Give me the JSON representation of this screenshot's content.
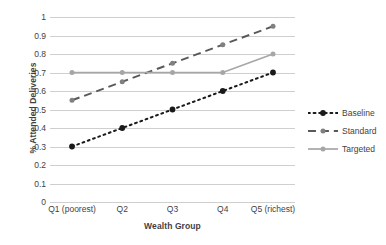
{
  "chart_data": {
    "type": "line",
    "title": "",
    "xlabel": "Wealth Group",
    "ylabel": "% Attended Deliveries",
    "categories": [
      "Q1 (poorest)",
      "Q2",
      "Q3",
      "Q4",
      "Q5 (richest)"
    ],
    "ylim": [
      0,
      1
    ],
    "yticks": [
      "0",
      "0.1",
      "0.2",
      "0.3",
      "0.4",
      "0.5",
      "0.6",
      "0.7",
      "0.8",
      "0.9",
      "1"
    ],
    "ytick_values": [
      0,
      0.1,
      0.2,
      0.3,
      0.4,
      0.5,
      0.6,
      0.7,
      0.8,
      0.9,
      1
    ],
    "grid": "horizontal",
    "legend_position": "right",
    "series": [
      {
        "name": "Baseline",
        "values": [
          0.3,
          0.4,
          0.5,
          0.6,
          0.7
        ],
        "color": "#1a1a1a",
        "line_style": "dotted",
        "marker": "circle",
        "marker_color": "#1a1a1a"
      },
      {
        "name": "Standard",
        "values": [
          0.55,
          0.65,
          0.75,
          0.85,
          0.95
        ],
        "color": "#595959",
        "line_style": "dashed",
        "marker": "circle",
        "marker_color": "#808080"
      },
      {
        "name": "Targeted",
        "values": [
          0.7,
          0.7,
          0.7,
          0.7,
          0.8
        ],
        "color": "#a6a6a6",
        "line_style": "solid",
        "marker": "circle",
        "marker_color": "#a6a6a6"
      }
    ]
  },
  "colors": {
    "gridline": "#cfcfcf",
    "text": "#3f3f3f",
    "background": "#ffffff"
  }
}
